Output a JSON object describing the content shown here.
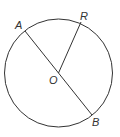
{
  "diagram": {
    "type": "circle-geometry",
    "stroke_color": "#333333",
    "circle": {
      "center_label": "O",
      "cx": 58.5,
      "cy": 73,
      "r": 54
    },
    "points": {
      "A": {
        "label": "A",
        "x": 25,
        "y": 31
      },
      "B": {
        "label": "B",
        "x": 92,
        "y": 115
      },
      "R": {
        "label": "R",
        "x": 81,
        "y": 22
      },
      "O": {
        "label": "O",
        "x": 58.5,
        "y": 73
      }
    },
    "segments": [
      {
        "name": "diameter-AB",
        "from": "A",
        "to": "B"
      },
      {
        "name": "radius-OR",
        "from": "O",
        "to": "R"
      }
    ]
  }
}
